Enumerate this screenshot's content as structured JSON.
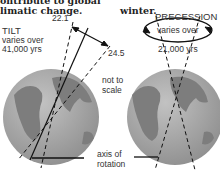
{
  "header": {
    "left_line1": "ontribute to global",
    "left_line2": "limatic change.",
    "right_line1": "",
    "right_line2": "winter."
  },
  "tilt": {
    "title": "TILT",
    "line1": "varies over",
    "line2": "41,000 yrs",
    "angle_min": "22.1",
    "angle_max": "24.5"
  },
  "precession": {
    "title": "PRECESSION",
    "line1": "varies over",
    "line2": "21,000 yrs"
  },
  "notes": {
    "not_to_scale_1": "not to",
    "not_to_scale_2": "scale",
    "axis_1": "axis of",
    "axis_2": "rotation"
  },
  "colors": {
    "globe": "#9a9a9a",
    "land": "#7d7d7d",
    "ocean": "#b4b4b4"
  }
}
